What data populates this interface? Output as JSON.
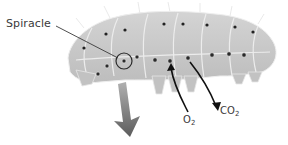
{
  "diagram": {
    "labels": {
      "spiracle": "Spiracle",
      "oxygen": "O",
      "oxygen_sub": "2",
      "carbon_dioxide": "CO",
      "carbon_dioxide_sub": "2"
    },
    "colors": {
      "body": "#c9c9c9",
      "body_shade": "#b3b3b3",
      "outline": "#e8e8e8",
      "spiracle_dot": "#2a2a2a",
      "arrow_black": "#111111",
      "big_arrow": "#6a6a6a",
      "text": "#3a3a3a"
    }
  }
}
